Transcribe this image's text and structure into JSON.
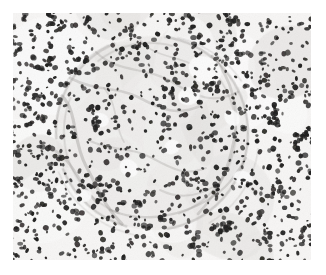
{
  "image": {
    "kind": "histopathology-micrograph",
    "subject": "renal glomerulus with dense inflammatory cell infiltrate",
    "stain": "hematoxylin and eosin",
    "rendering": "grayscale",
    "canvas": {
      "width": 326,
      "height": 275
    },
    "content_area": {
      "x": 13,
      "y": 13,
      "width": 298,
      "height": 247
    },
    "margin_color": "#ffffff"
  },
  "palette": {
    "margin": "#ffffff",
    "background_light": "#f7f6f5",
    "background_mid": "#e6e4e2",
    "stroma_gray": "#b9b6b3",
    "fiber_gray": "#8e8b88",
    "capsule_gray": "#9a9794",
    "nucleus_dark": "#1d1c1b",
    "nucleus_mid": "#3c3a38",
    "nucleus_soft": "#5a5754",
    "lumen_white": "#fdfdfd"
  },
  "structures": {
    "glomerulus": {
      "label": "glomerular tuft",
      "center_x": 152,
      "center_y": 133,
      "radius_x": 96,
      "radius_y": 97,
      "rotation_deg": -8,
      "capsule_opacity": 0.42
    },
    "capsular_arcs": [
      {
        "cx": 152,
        "cy": 133,
        "rx": 96,
        "ry": 97,
        "rot": -8,
        "dash": "150 40 90 30 120 50",
        "width": 2.4,
        "opacity": 0.4
      },
      {
        "cx": 150,
        "cy": 131,
        "rx": 86,
        "ry": 88,
        "rot": 5,
        "dash": "100 60 140 45 80 40",
        "width": 1.8,
        "opacity": 0.3
      },
      {
        "cx": 155,
        "cy": 136,
        "rx": 104,
        "ry": 101,
        "rot": 14,
        "dash": "80 70 110 90 60 70",
        "width": 1.6,
        "opacity": 0.22
      }
    ],
    "lumina": [
      {
        "cx": 205,
        "cy": 70,
        "rx": 17,
        "ry": 13,
        "rot": 25
      },
      {
        "cx": 189,
        "cy": 96,
        "rx": 11,
        "ry": 9,
        "rot": -15
      },
      {
        "cx": 129,
        "cy": 168,
        "rx": 10,
        "ry": 8,
        "rot": 40
      },
      {
        "cx": 100,
        "cy": 120,
        "rx": 9,
        "ry": 7,
        "rot": 10
      },
      {
        "cx": 172,
        "cy": 147,
        "rx": 8,
        "ry": 7,
        "rot": -30
      },
      {
        "cx": 232,
        "cy": 118,
        "rx": 9,
        "ry": 7,
        "rot": 55
      },
      {
        "cx": 84,
        "cy": 196,
        "rx": 8,
        "ry": 6,
        "rot": -20
      },
      {
        "cx": 243,
        "cy": 178,
        "rx": 10,
        "ry": 7,
        "rot": 15
      }
    ],
    "fiber_strands": [
      {
        "d": "M 62 96 C 78 112, 72 140, 86 166 S 104 206, 122 224",
        "width": 3.2,
        "opacity": 0.34
      },
      {
        "d": "M 70 78 C 96 92, 118 86, 140 98 S 178 116, 200 106",
        "width": 2.6,
        "opacity": 0.28
      },
      {
        "d": "M 96 52 C 118 74, 146 66, 172 82 S 214 104, 238 92",
        "width": 2.2,
        "opacity": 0.24
      },
      {
        "d": "M 212 56 C 232 78, 240 110, 234 140 S 220 190, 198 214",
        "width": 2.8,
        "opacity": 0.3
      },
      {
        "d": "M 110 210 C 138 222, 170 218, 196 206 S 232 182, 246 158",
        "width": 2.4,
        "opacity": 0.28
      },
      {
        "d": "M 88 140 C 112 152, 130 146, 152 158 S 186 176, 206 168",
        "width": 2.0,
        "opacity": 0.26
      },
      {
        "d": "M 54 150 C 72 160, 80 184, 96 202",
        "width": 2.6,
        "opacity": 0.3
      },
      {
        "d": "M 140 40 C 156 60, 182 54, 200 70",
        "width": 1.8,
        "opacity": 0.22
      },
      {
        "d": "M 160 190 C 180 200, 200 196, 218 184",
        "width": 2.0,
        "opacity": 0.24
      },
      {
        "d": "M 104 88 C 118 104, 114 126, 124 142",
        "width": 1.8,
        "opacity": 0.22
      }
    ]
  },
  "texture": {
    "nuclei_count": 900,
    "nuclei_seed": 20250117,
    "blur_stdev": 0.55,
    "grain_opacity": 0.08,
    "nucleus_size_min": 2.4,
    "nucleus_size_max": 6.2,
    "density_outside": 1.0,
    "density_inside": 0.78
  },
  "caption": {
    "alt_text": "Grayscale photomicrograph of hematoxylin and eosin stained tissue showing a rounded glomerulus at the center surrounded by densely packed dark-staining inflammatory cell nuclei."
  }
}
